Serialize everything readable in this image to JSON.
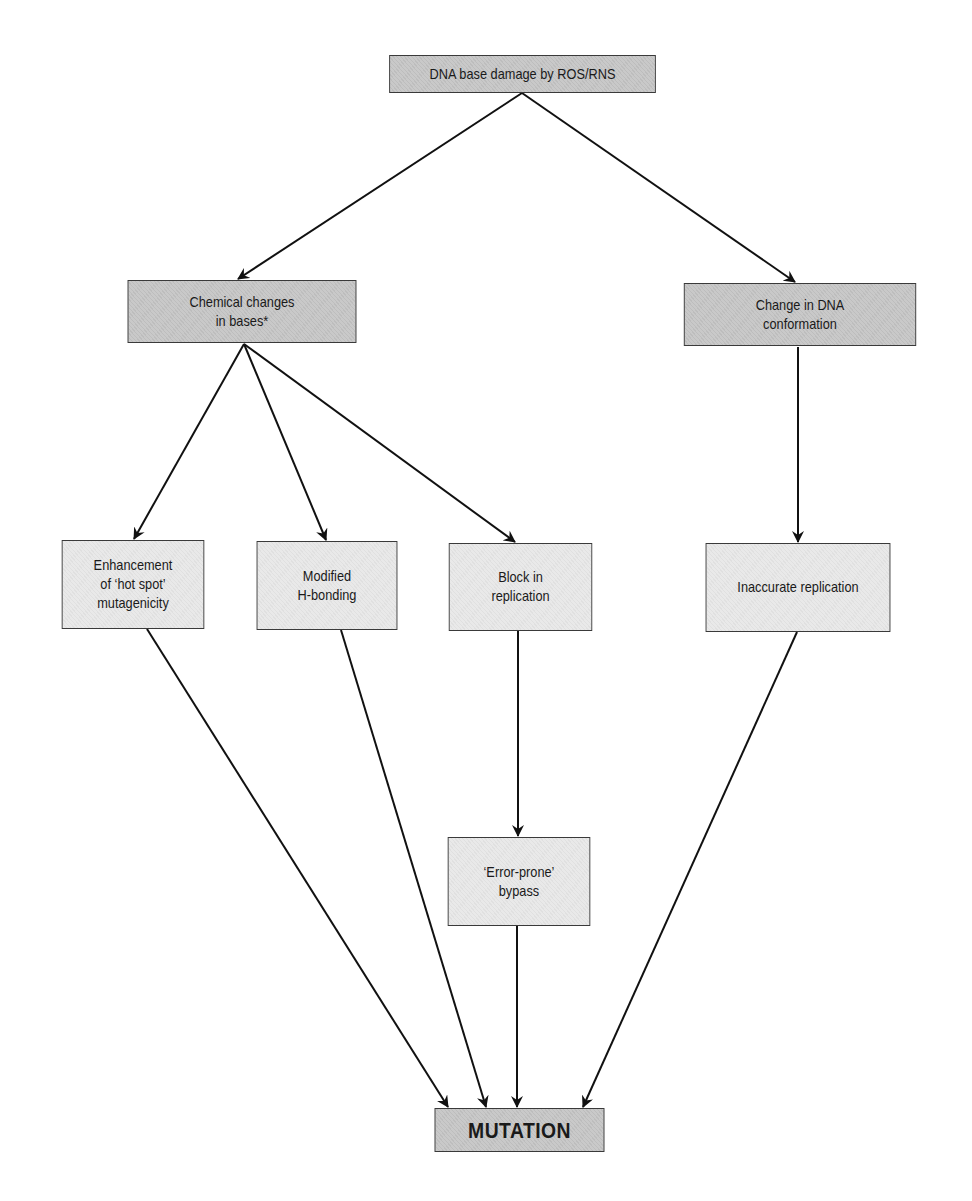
{
  "diagram": {
    "type": "flowchart",
    "nodes": {
      "root": {
        "label": "DNA base damage by ROS/RNS",
        "style": "dark"
      },
      "chemical": {
        "label": "Chemical changes\nin bases*",
        "style": "dark"
      },
      "conformation": {
        "label": "Change in DNA\nconformation",
        "style": "dark"
      },
      "hotspot": {
        "label": "Enhancement\nof ‘hot spot’\nmutagenicity",
        "style": "light"
      },
      "hbonding": {
        "label": "Modified\nH-bonding",
        "style": "light"
      },
      "block": {
        "label": "Block in\nreplication",
        "style": "light"
      },
      "inaccurate": {
        "label": "Inaccurate replication",
        "style": "light"
      },
      "bypass": {
        "label": "‘Error-prone’\nbypass",
        "style": "light"
      },
      "mutation": {
        "label": "MUTATION",
        "style": "dark"
      }
    },
    "edges": [
      [
        "root",
        "chemical"
      ],
      [
        "root",
        "conformation"
      ],
      [
        "chemical",
        "hotspot"
      ],
      [
        "chemical",
        "hbonding"
      ],
      [
        "chemical",
        "block"
      ],
      [
        "conformation",
        "inaccurate"
      ],
      [
        "block",
        "bypass"
      ],
      [
        "hotspot",
        "mutation"
      ],
      [
        "hbonding",
        "mutation"
      ],
      [
        "bypass",
        "mutation"
      ],
      [
        "inaccurate",
        "mutation"
      ]
    ],
    "colors": {
      "dark_fill": "#c9c9c9",
      "light_fill": "#e9e9e9",
      "line": "#111111"
    }
  }
}
